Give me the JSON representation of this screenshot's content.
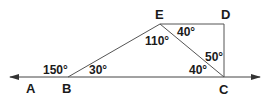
{
  "diagram": {
    "type": "geometry",
    "points": {
      "A": {
        "label": "A",
        "x": 30,
        "y": 89
      },
      "B": {
        "label": "B",
        "x": 68,
        "y": 77
      },
      "C": {
        "label": "C",
        "x": 224,
        "y": 77
      },
      "D": {
        "label": "D",
        "x": 224,
        "y": 24
      },
      "E": {
        "label": "E",
        "x": 160,
        "y": 24
      }
    },
    "segments": [
      "B-E",
      "E-D",
      "D-C",
      "E-C"
    ],
    "line": {
      "from_x": 8,
      "to_x": 262,
      "y": 77,
      "arrows": "both"
    },
    "angles": [
      {
        "label": "150°",
        "at": "B",
        "desc": "angle ABE"
      },
      {
        "label": "30°",
        "at": "B",
        "desc": "angle EBC"
      },
      {
        "label": "110°",
        "at": "E",
        "desc": "angle BEC"
      },
      {
        "label": "40°",
        "at": "E",
        "desc": "angle CED"
      },
      {
        "label": "40°",
        "at": "C",
        "desc": "angle BCE"
      },
      {
        "label": "50°",
        "at": "C",
        "desc": "angle ECD"
      }
    ],
    "stroke_color": "#444444"
  }
}
